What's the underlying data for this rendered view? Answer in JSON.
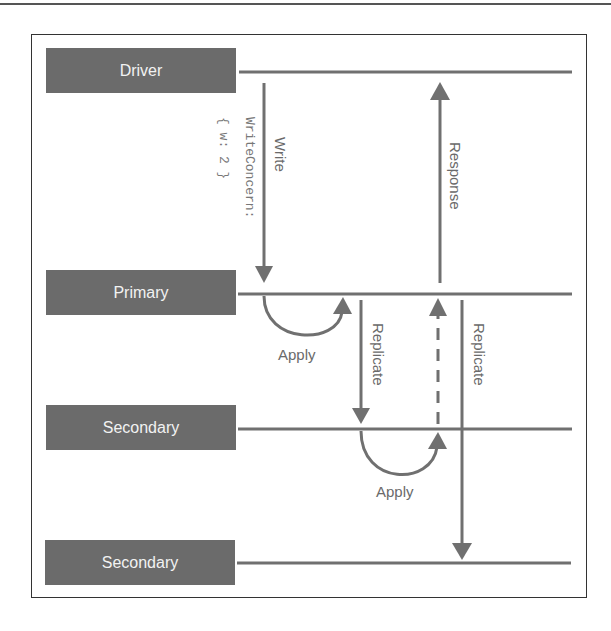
{
  "diagram": {
    "title": "",
    "nodes": [
      {
        "id": "driver",
        "label": "Driver"
      },
      {
        "id": "primary",
        "label": "Primary"
      },
      {
        "id": "secondary1",
        "label": "Secondary"
      },
      {
        "id": "secondary2",
        "label": "Secondary"
      }
    ],
    "edges": [
      {
        "from": "driver",
        "to": "primary",
        "label": "Write",
        "sublabel_line1": "WriteConcern:",
        "sublabel_line2": "{ w: 2 }",
        "style": "solid"
      },
      {
        "from": "primary",
        "to": "primary",
        "label": "Apply",
        "style": "arc"
      },
      {
        "from": "primary",
        "to": "secondary1",
        "label": "Replicate",
        "style": "solid"
      },
      {
        "from": "secondary1",
        "to": "secondary1",
        "label": "Apply",
        "style": "arc"
      },
      {
        "from": "secondary1",
        "to": "primary",
        "label": "",
        "style": "dashed"
      },
      {
        "from": "primary",
        "to": "secondary2",
        "label": "Replicate",
        "style": "solid"
      },
      {
        "from": "primary",
        "to": "driver",
        "label": "Response",
        "style": "solid"
      }
    ],
    "colors": {
      "node_fill": "#6b6b6b",
      "node_text": "#f2f2f2",
      "line": "#707070",
      "label": "#6a6a6a",
      "frame": "#333333"
    }
  }
}
